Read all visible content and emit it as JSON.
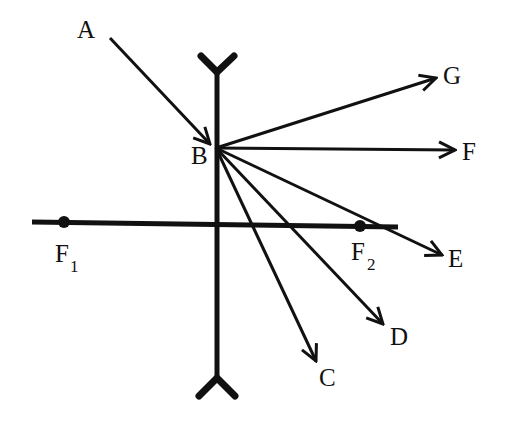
{
  "diagram": {
    "type": "ray-diagram",
    "colors": {
      "ink": "#111111",
      "background": "#ffffff"
    },
    "lens": {
      "kind": "diverging-lens-symbol"
    },
    "optical_axis": {
      "label": "principal axis"
    },
    "focal_points": [
      {
        "id": "F1",
        "base": "F",
        "subscript": "1"
      },
      {
        "id": "F2",
        "base": "F",
        "subscript": "2"
      }
    ],
    "incident_ray": {
      "from": "A",
      "to": "B"
    },
    "point_labels": {
      "A": "A",
      "B": "B",
      "C": "C",
      "D": "D",
      "E": "E",
      "F": "F",
      "G": "G"
    },
    "refracted_ray_options": [
      "G",
      "F",
      "E",
      "D",
      "C"
    ]
  }
}
